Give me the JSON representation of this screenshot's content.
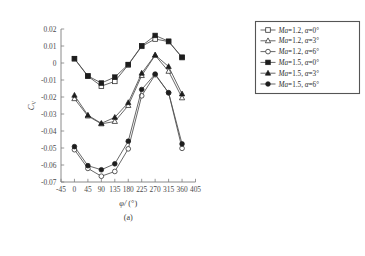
{
  "figure": {
    "caption": "(a)",
    "xlabel_main": "φ/",
    "xlabel_unit": "(°)",
    "ylabel_main": "C",
    "ylabel_sub": "V"
  },
  "legend": {
    "entries": [
      {
        "label_ma": "Ma",
        "label_rest": "=1.2,",
        "label_alpha": "α",
        "label_val": "=0°",
        "marker": "open-square",
        "full": "Ma=1.2, α=0°"
      },
      {
        "label_ma": "Ma",
        "label_rest": "=1.2,",
        "label_alpha": "α",
        "label_val": "=3°",
        "marker": "open-triangle",
        "full": "Ma=1.2, α=3°"
      },
      {
        "label_ma": "Ma",
        "label_rest": "=1.2,",
        "label_alpha": "α",
        "label_val": "=6°",
        "marker": "open-circle",
        "full": "Ma=1.2, α=6°"
      },
      {
        "label_ma": "Ma",
        "label_rest": "=1.5,",
        "label_alpha": "α",
        "label_val": "=0°",
        "marker": "filled-square",
        "full": "Ma=1.5, α=0°"
      },
      {
        "label_ma": "Ma",
        "label_rest": "=1.5,",
        "label_alpha": "α",
        "label_val": "=3°",
        "marker": "filled-triangle",
        "full": "Ma=1.5, α=3°"
      },
      {
        "label_ma": "Ma",
        "label_rest": "=1.5,",
        "label_alpha": "α",
        "label_val": "=6°",
        "marker": "filled-circle",
        "full": "Ma=1.5, α=6°"
      }
    ]
  },
  "chart_data": {
    "type": "line",
    "title": "",
    "subtitle": "(a)",
    "xlabel": "φ/ (°)",
    "ylabel": "C_V",
    "xlim": [
      -45,
      405
    ],
    "ylim": [
      -0.07,
      0.02
    ],
    "xticks": [
      -45,
      0,
      45,
      90,
      135,
      180,
      225,
      270,
      315,
      360,
      405
    ],
    "yticks": [
      0.02,
      0.01,
      0,
      -0.01,
      -0.02,
      -0.03,
      -0.04,
      -0.05,
      -0.06,
      -0.07
    ],
    "xticklabels": [
      "-45",
      "0",
      "45",
      "90",
      "135",
      "180",
      "225",
      "270",
      "315",
      "360",
      "405"
    ],
    "yticklabels": [
      "0.02",
      "0.01",
      "0",
      "-0.01",
      "-0.02",
      "-0.03",
      "-0.04",
      "-0.05",
      "-0.06",
      "-0.07"
    ],
    "grid": false,
    "legend_position": "right-outside",
    "x": [
      0,
      45,
      90,
      135,
      180,
      225,
      270,
      315,
      360
    ],
    "series": [
      {
        "name": "Ma=1.2, α=0°",
        "marker": "open-square",
        "values": [
          0.0025,
          -0.0078,
          -0.0136,
          -0.0108,
          -0.0011,
          0.0098,
          0.0141,
          0.0126,
          0.0032
        ]
      },
      {
        "name": "Ma=1.2, α=3°",
        "marker": "open-triangle",
        "values": [
          -0.021,
          -0.0312,
          -0.0358,
          -0.0344,
          -0.025,
          -0.0074,
          0.0045,
          -0.0049,
          -0.0205
        ]
      },
      {
        "name": "Ma=1.2, α=6°",
        "marker": "open-circle",
        "values": [
          -0.051,
          -0.062,
          -0.0666,
          -0.0638,
          -0.0505,
          -0.0193,
          -0.0069,
          -0.0175,
          -0.0502
        ]
      },
      {
        "name": "Ma=1.5, α=0°",
        "marker": "filled-square",
        "values": [
          0.0026,
          -0.0076,
          -0.0118,
          -0.0083,
          -0.0009,
          0.0101,
          0.0162,
          0.0128,
          0.0034
        ]
      },
      {
        "name": "Ma=1.5, α=3°",
        "marker": "filled-triangle",
        "values": [
          -0.019,
          -0.0307,
          -0.0355,
          -0.032,
          -0.0233,
          -0.006,
          0.0047,
          -0.0021,
          -0.0182
        ]
      },
      {
        "name": "Ma=1.5, α=6°",
        "marker": "filled-circle",
        "values": [
          -0.0492,
          -0.0604,
          -0.0628,
          -0.0593,
          -0.046,
          -0.0156,
          -0.0065,
          -0.0175,
          -0.0476
        ]
      }
    ]
  }
}
